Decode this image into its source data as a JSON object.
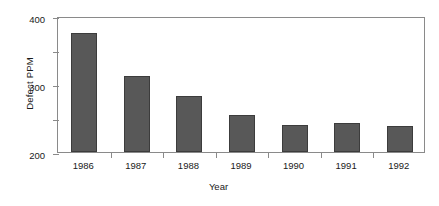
{
  "chart_data": {
    "type": "bar",
    "title": "",
    "xlabel": "Year",
    "ylabel": "Defect PPM",
    "categories": [
      "1986",
      "1987",
      "1988",
      "1989",
      "1990",
      "1991",
      "1992"
    ],
    "values": [
      350,
      225,
      164,
      110,
      80,
      86,
      77
    ],
    "ylim": [
      0,
      400
    ],
    "yticks": [
      0,
      100,
      200,
      300,
      400
    ],
    "ytick_labels": [
      "0",
      "100",
      "200",
      "300",
      "400"
    ],
    "grid": false,
    "legend": false,
    "bar_color": "#585858",
    "bar_edge_color": "#3c3c3c",
    "axis_color": "#8a8a8a",
    "background": "#ffffff"
  }
}
